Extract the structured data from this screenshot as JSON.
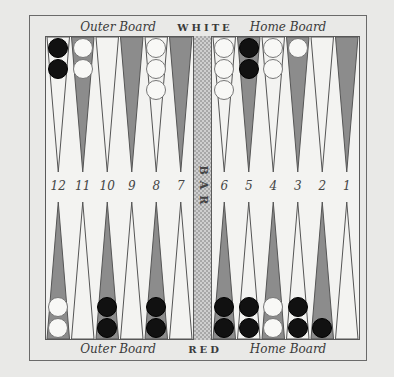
{
  "header": {
    "left_label": "Outer Board",
    "center_label": "WHITE",
    "right_label": "Home Board"
  },
  "footer": {
    "left_label": "Outer Board",
    "center_label": "RED",
    "right_label": "Home Board"
  },
  "bar": {
    "label": "BAR"
  },
  "point_numbers": [
    "12",
    "11",
    "10",
    "9",
    "8",
    "7",
    "6",
    "5",
    "4",
    "3",
    "2",
    "1"
  ],
  "colors": {
    "dark_point": "#8c8c8c",
    "light_point": "#f3f3f1",
    "black_checker": "#111111",
    "white_checker": "#f8f8f6",
    "background": "#e9e9e7"
  },
  "top_row": {
    "checkers": [
      {
        "column": 1,
        "color": "black",
        "count": 2
      },
      {
        "column": 2,
        "color": "white",
        "count": 2
      },
      {
        "column": 5,
        "color": "white",
        "count": 3
      },
      {
        "column": 7,
        "color": "white",
        "count": 3
      },
      {
        "column": 8,
        "color": "black",
        "count": 2
      },
      {
        "column": 9,
        "color": "white",
        "count": 2
      },
      {
        "column": 10,
        "color": "white",
        "count": 1
      }
    ]
  },
  "bottom_row": {
    "checkers": [
      {
        "column": 1,
        "color": "white",
        "count": 2
      },
      {
        "column": 3,
        "color": "black",
        "count": 2
      },
      {
        "column": 5,
        "color": "black",
        "count": 2
      },
      {
        "column": 7,
        "color": "black",
        "count": 2
      },
      {
        "column": 8,
        "color": "black",
        "count": 2
      },
      {
        "column": 9,
        "color": "white",
        "count": 2
      },
      {
        "column": 10,
        "color": "black",
        "count": 2
      },
      {
        "column": 11,
        "color": "black",
        "count": 1
      }
    ]
  }
}
